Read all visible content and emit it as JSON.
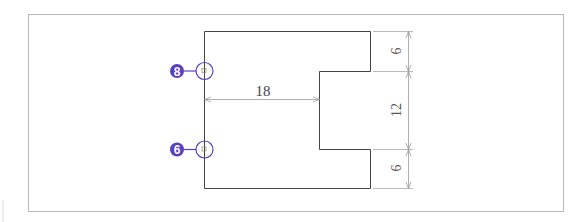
{
  "drawing": {
    "frame": {
      "x": 28,
      "y": 14,
      "w": 535,
      "h": 197,
      "color": "#b8b8b8"
    },
    "part_outline_color": "#444444",
    "dimension_color": "#9a9a9a",
    "balloon_color": "#5a3fc0",
    "dimensions": {
      "top_thickness": "6",
      "gap": "12",
      "bottom_thickness": "6",
      "inner_depth": "18"
    },
    "balloons": [
      {
        "label": "8",
        "target": "upper-inner-corner"
      },
      {
        "label": "6",
        "target": "lower-inner-corner"
      }
    ]
  }
}
